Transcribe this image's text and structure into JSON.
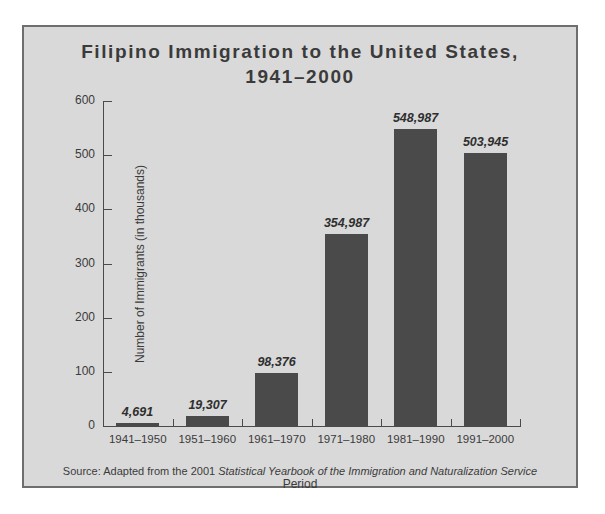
{
  "figure": {
    "title_line1": "Filipino Immigration to the United States,",
    "title_line2": "1941–2000",
    "source_prefix": "Source: Adapted from the 2001 ",
    "source_italic": "Statistical Yearbook of the Immigration and Naturalization Service",
    "panel_bg": "#d9d9d9",
    "frame_color": "#6e6e6e",
    "bar_color": "#4a4a4a",
    "text_color": "#3b3b3b"
  },
  "chart_data": {
    "type": "bar",
    "title": "Filipino Immigration to the United States, 1941–2000",
    "xlabel": "Period",
    "ylabel": "Number of Immigrants (in thousands)",
    "categories": [
      "1941–1950",
      "1951–1960",
      "1961–1970",
      "1971–1980",
      "1981–1990",
      "1991–2000"
    ],
    "values": [
      4.691,
      19.307,
      98.376,
      354.987,
      548.987,
      503.945
    ],
    "value_labels": [
      "4,691",
      "19,307",
      "98,376",
      "354,987",
      "548,987",
      "503,945"
    ],
    "ylim": [
      0,
      600
    ],
    "yticks": [
      0,
      100,
      200,
      300,
      400,
      500,
      600
    ],
    "ytick_labels": [
      "0",
      "100",
      "200",
      "300",
      "400",
      "500",
      "600"
    ],
    "grid": false,
    "legend": "none",
    "units": "thousands"
  }
}
